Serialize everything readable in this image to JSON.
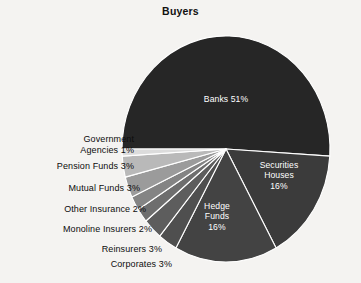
{
  "chart_data": {
    "type": "pie",
    "title": "Buyers",
    "xlabel": "",
    "ylabel": "",
    "legend_position": "none",
    "grid": false,
    "units": "percent",
    "categories": [
      "Banks",
      "Securities Houses",
      "Hedge Funds",
      "Corporates",
      "Reinsurers",
      "Monoline Insurers",
      "Other Insurance",
      "Mutual Funds",
      "Pension Funds",
      "Government Agencies"
    ],
    "values": [
      51,
      16,
      16,
      3,
      3,
      2,
      2,
      3,
      3,
      1
    ],
    "slices": [
      {
        "label": "Banks",
        "value": 51,
        "display": "Banks 51%",
        "color": "#262626",
        "label_placement": "inside"
      },
      {
        "label": "Securities Houses",
        "value": 16,
        "display": "Securities Houses 16%",
        "color": "#3b3b3b",
        "label_placement": "inside"
      },
      {
        "label": "Hedge Funds",
        "value": 16,
        "display": "Hedge Funds 16%",
        "color": "#434343",
        "label_placement": "inside"
      },
      {
        "label": "Corporates",
        "value": 3,
        "display": "Corporates 3%",
        "color": "#4f4f4f",
        "label_placement": "outside"
      },
      {
        "label": "Reinsurers",
        "value": 3,
        "display": "Reinsurers 3%",
        "color": "#5d5d5d",
        "label_placement": "outside"
      },
      {
        "label": "Monoline Insurers",
        "value": 2,
        "display": "Monoline Insurers 2%",
        "color": "#6e6e6e",
        "label_placement": "outside"
      },
      {
        "label": "Other Insurance",
        "value": 2,
        "display": "Other Insurance 2%",
        "color": "#848484",
        "label_placement": "outside"
      },
      {
        "label": "Mutual Funds",
        "value": 3,
        "display": "Mutual Funds 3%",
        "color": "#9b9b9b",
        "label_placement": "outside"
      },
      {
        "label": "Pension Funds",
        "value": 3,
        "display": "Pension Funds 3%",
        "color": "#b9b9b9",
        "label_placement": "outside"
      },
      {
        "label": "Government Agencies",
        "value": 1,
        "display": "Government Agencies 1%",
        "color": "#dcdcdc",
        "label_placement": "outside"
      }
    ]
  },
  "inside_labels": {
    "banks": "Banks 51%",
    "securities_houses": "Securities\nHouses\n16%",
    "hedge_funds": "Hedge\nFunds\n16%"
  },
  "outside_labels": [
    {
      "key": "government-agencies",
      "text": "Government\nAgencies 1%"
    },
    {
      "key": "pension-funds",
      "text": "Pension Funds 3%"
    },
    {
      "key": "mutual-funds",
      "text": "Mutual Funds 3%"
    },
    {
      "key": "other-insurance",
      "text": "Other Insurance 2%"
    },
    {
      "key": "monoline-insurers",
      "text": "Monoline Insurers 2%"
    },
    {
      "key": "reinsurers",
      "text": "Reinsurers 3%"
    },
    {
      "key": "corporates",
      "text": "Corporates 3%"
    }
  ],
  "colors": {
    "background": "#f4f3f1",
    "slice_separator": "#ffffff",
    "inside_text": "#ffffff",
    "outside_text": "#0d0d0d",
    "title_text": "#111111"
  },
  "geometry": {
    "center_x": 226,
    "center_y": 149,
    "radius_x": 104,
    "radius_y": 113,
    "start_angle_deg": 180,
    "direction": "clockwise"
  }
}
